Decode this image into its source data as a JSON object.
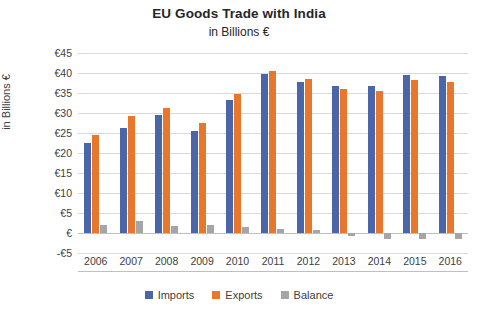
{
  "chart_data": {
    "type": "bar",
    "title": "EU Goods Trade with India",
    "subtitle": "in Billions €",
    "xlabel": "",
    "ylabel": "in Billions €",
    "categories": [
      "2006",
      "2007",
      "2008",
      "2009",
      "2010",
      "2011",
      "2012",
      "2013",
      "2014",
      "2015",
      "2016"
    ],
    "series": [
      {
        "name": "Imports",
        "color": "#4A66A8",
        "values": [
          22.5,
          26.3,
          29.5,
          25.4,
          33.2,
          39.7,
          37.7,
          36.8,
          36.8,
          39.6,
          39.3
        ]
      },
      {
        "name": "Exports",
        "color": "#E8762C",
        "values": [
          24.5,
          29.2,
          31.3,
          27.4,
          34.8,
          40.6,
          38.4,
          36.0,
          35.4,
          38.2,
          37.8
        ]
      },
      {
        "name": "Balance",
        "color": "#A5A5A5",
        "values": [
          2.0,
          2.9,
          1.8,
          2.0,
          1.6,
          0.9,
          0.7,
          -0.8,
          -1.4,
          -1.4,
          -1.5
        ]
      }
    ],
    "ylim": [
      -5,
      45
    ],
    "ytick_step": 5,
    "ytick_labels": [
      "€45",
      "€40",
      "€35",
      "€30",
      "€25",
      "€20",
      "€15",
      "€10",
      "€5",
      "€",
      "-€5"
    ],
    "ytick_values": [
      45,
      40,
      35,
      30,
      25,
      20,
      15,
      10,
      5,
      0,
      -5
    ],
    "grid": true,
    "legend_position": "bottom"
  }
}
